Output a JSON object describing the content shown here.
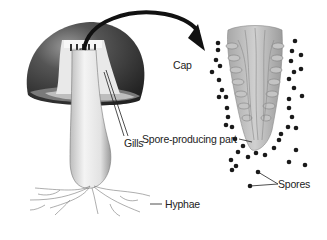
{
  "diagram": {
    "labels": {
      "cap": "Cap",
      "gills": "Gills",
      "spore_part": "Spore-producing part",
      "spores": "Spores",
      "hyphae": "Hyphae"
    },
    "colors": {
      "cap_dark": "#3a3a3a",
      "stalk": "#e6e6e6",
      "gill_section": "#b8b8b8",
      "spore": "#1a1a1a",
      "arrow": "#111111"
    }
  }
}
